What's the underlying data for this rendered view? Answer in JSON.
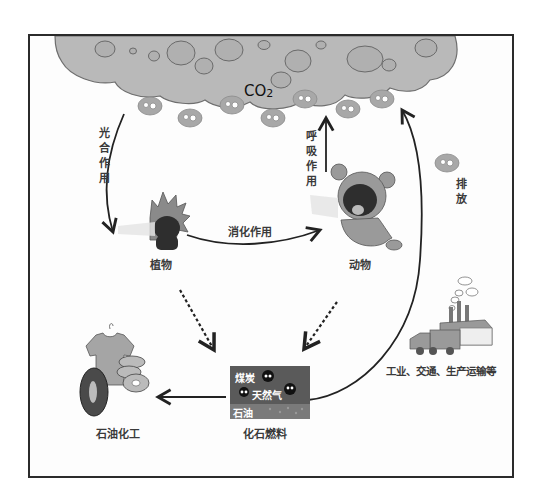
{
  "diagram": {
    "reservoir": {
      "label": "CO",
      "subscript": "2"
    },
    "nodes": {
      "plant": "植物",
      "animal": "动物",
      "fossil_fuel": "化石燃料",
      "petrochemical": "石油化工",
      "industry": "工业、交通、生产运输等"
    },
    "fossil_fuel_contents": {
      "coal": "煤炭",
      "natural_gas": "天然气",
      "oil": "石油"
    },
    "processes": {
      "photosynthesis": "光合作用",
      "respiration": "呼吸作用",
      "digestion": "消化作用",
      "emission": "排放"
    },
    "edges": [
      {
        "from": "CO2",
        "to": "植物",
        "label": "光合作用",
        "style": "solid"
      },
      {
        "from": "动物",
        "to": "CO2",
        "label": "呼吸作用",
        "style": "solid"
      },
      {
        "from": "植物",
        "to": "动物",
        "label": "消化作用",
        "style": "solid"
      },
      {
        "from": "植物",
        "to": "化石燃料",
        "label": "",
        "style": "dashed"
      },
      {
        "from": "动物",
        "to": "化石燃料",
        "label": "",
        "style": "dashed"
      },
      {
        "from": "化石燃料",
        "to": "石油化工",
        "label": "",
        "style": "solid"
      },
      {
        "from": "化石燃料",
        "to": "CO2",
        "label": "排放",
        "style": "solid"
      }
    ],
    "colors": {
      "cloud": "#b9b9b9",
      "cloud_stroke": "#6e6e6e",
      "arrow": "#222222",
      "frame": "#2b2b2b"
    }
  }
}
